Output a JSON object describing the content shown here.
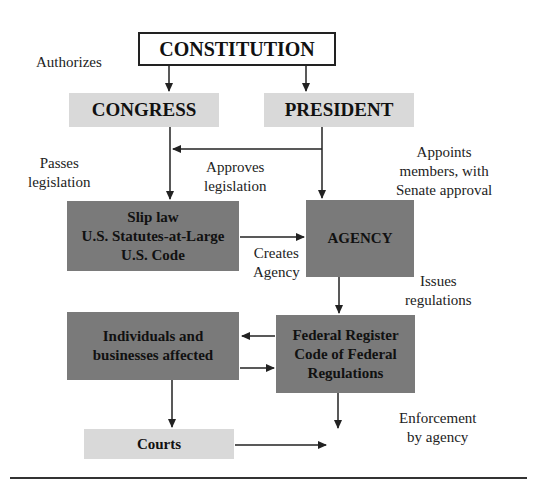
{
  "diagram": {
    "boxes": {
      "constitution": "CONSTITUTION",
      "congress": "CONGRESS",
      "president": "PRESIDENT",
      "sliplaw": [
        "Slip law",
        "U.S. Statutes-at-Large",
        "U.S. Code"
      ],
      "agency": "AGENCY",
      "individuals": [
        "Individuals and",
        "businesses affected"
      ],
      "federal_register": [
        "Federal Register",
        "Code of Federal",
        "Regulations"
      ],
      "courts": "Courts"
    },
    "labels": {
      "authorizes": "Authorizes",
      "passes": [
        "Passes",
        "legislation"
      ],
      "approves": [
        "Approves",
        "legislation"
      ],
      "appoints": [
        "Appoints",
        "members, with",
        "Senate approval"
      ],
      "creates": [
        "Creates",
        "Agency"
      ],
      "issues": [
        "Issues",
        "regulations"
      ],
      "enforcement": [
        "Enforcement",
        "by agency"
      ]
    },
    "colors": {
      "light_box": "#d9d9d9",
      "dark_box": "#7a7a7a",
      "line": "#222222"
    }
  }
}
